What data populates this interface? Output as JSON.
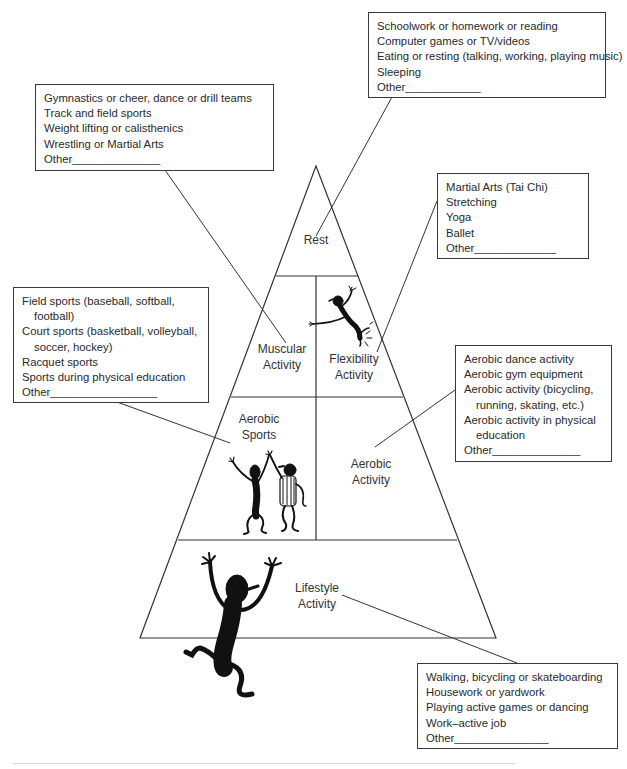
{
  "pyramid": {
    "levels": {
      "rest": "Rest",
      "muscular": [
        "Muscular",
        "Activity"
      ],
      "flexibility": [
        "Flexibility",
        "Activity"
      ],
      "aerobic_sports": [
        "Aerobic",
        "Sports"
      ],
      "aerobic_activity": [
        "Aerobic",
        "Activity"
      ],
      "lifestyle": [
        "Lifestyle",
        "Activity"
      ]
    },
    "line_color": "#333333"
  },
  "boxes": {
    "rest": {
      "items": [
        "Schoolwork or homework or reading",
        "Computer games or TV/videos",
        "Eating or resting (talking, working, playing music)",
        "Sleeping",
        "Other____________"
      ]
    },
    "muscular": {
      "items": [
        "Gymnastics or cheer, dance or drill teams",
        "Track and field sports",
        "Weight lifting or calisthenics",
        "Wrestling or Martial Arts",
        "Other______________"
      ]
    },
    "flexibility": {
      "items": [
        "Martial Arts (Tai Chi)",
        "Stretching",
        "Yoga",
        "Ballet",
        "Other_____________"
      ]
    },
    "aerobic_sports": {
      "items": [
        "Field sports (baseball, softball,",
        "football)",
        "Court sports (basketball, volleyball,",
        "soccer, hockey)",
        "Racquet sports",
        "Sports during physical education",
        "Other_________________"
      ]
    },
    "aerobic_activity": {
      "items": [
        "Aerobic dance activity",
        "Aerobic gym equipment",
        "Aerobic activity (bicycling,",
        "running, skating, etc.)",
        "Aerobic activity in physical",
        "education",
        "Other______________"
      ]
    },
    "lifestyle": {
      "items": [
        "Walking, bicycling or skateboarding",
        "Housework or yardwork",
        "Playing active games or dancing",
        "Work–active job",
        "Other_______________"
      ]
    }
  }
}
